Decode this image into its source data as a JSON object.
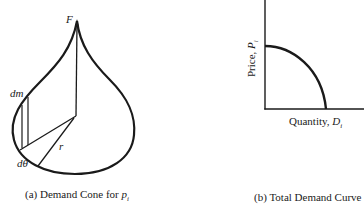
{
  "panel_a": {
    "caption": "(a) Demand Cone for ",
    "caption_var": "p",
    "caption_sub": "i",
    "labels": {
      "apex": "F",
      "mass": "dm",
      "angle": "dθ",
      "radius": "r"
    }
  },
  "panel_b": {
    "caption": "(b) Total Demand Curve",
    "ylabel_text": "Price, ",
    "ylabel_var": "P",
    "ylabel_sub": "i",
    "xlabel_text": "Quantity, ",
    "xlabel_var": "D",
    "xlabel_sub": "i"
  },
  "colors": {
    "ink": "#1a1a1a",
    "background": "#ffffff"
  }
}
